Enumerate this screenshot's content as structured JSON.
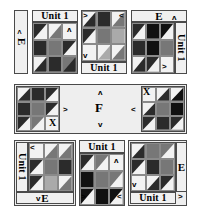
{
  "diagram": {
    "palette": {
      "background": "#ffffff",
      "light": "#f2f2f2",
      "medium": "#777777",
      "dark": "#2b2b2b",
      "black": "#111111",
      "border": "#4a4a4a",
      "strip": "#f0f0f0"
    },
    "labels": {
      "unit": "Unit 1",
      "e": "E",
      "f": "F",
      "x": "X"
    },
    "arrows": {
      "up": "ʌ",
      "down": "v",
      "left": "<",
      "right": ">"
    },
    "rows": [
      {
        "name": "top-row",
        "blocks": [
          {
            "id": "top-1",
            "strips": [
              {
                "label": "E",
                "orientation": "vertical",
                "position": "left"
              }
            ],
            "markers": [
              "<"
            ]
          },
          {
            "id": "top-2",
            "strips": [
              {
                "label": "Unit 1",
                "orientation": "horizontal",
                "position": "top"
              }
            ],
            "markers": [
              "ʌ"
            ]
          },
          {
            "id": "top-3",
            "strips": [
              {
                "label": "Unit 1",
                "orientation": "horizontal",
                "position": "bottom"
              }
            ],
            "markers": [
              ">",
              "<",
              "v"
            ]
          },
          {
            "id": "top-4",
            "strips": [
              {
                "label": "E",
                "orientation": "horizontal",
                "position": "top"
              },
              {
                "label": "Unit 1",
                "orientation": "vertical",
                "position": "right"
              }
            ],
            "markers": [
              "ʌ",
              ">"
            ]
          }
        ]
      },
      {
        "name": "middle-row",
        "blocks": [
          {
            "id": "mid-left-paw",
            "markers": [
              "X"
            ]
          },
          {
            "id": "mid-panel",
            "label": "F",
            "markers": [
              "ʌ",
              "v",
              ">",
              "<"
            ]
          },
          {
            "id": "mid-right-paw",
            "markers": [
              "X"
            ]
          }
        ]
      },
      {
        "name": "bottom-row",
        "blocks": [
          {
            "id": "bot-1",
            "strips": [
              {
                "label": "Unit 1",
                "orientation": "vertical",
                "position": "left"
              },
              {
                "label": "E",
                "orientation": "horizontal",
                "position": "bottom"
              }
            ],
            "markers": [
              "<",
              "v"
            ]
          },
          {
            "id": "bot-2",
            "strips": [
              {
                "label": "Unit 1",
                "orientation": "horizontal",
                "position": "top"
              }
            ],
            "markers": [
              "ʌ",
              ">",
              "<"
            ]
          },
          {
            "id": "bot-3",
            "strips": [
              {
                "label": "Unit 1",
                "orientation": "horizontal",
                "position": "bottom"
              },
              {
                "label": "E",
                "orientation": "vertical",
                "position": "right"
              }
            ],
            "markers": [
              "v",
              ">"
            ]
          }
        ]
      }
    ]
  }
}
